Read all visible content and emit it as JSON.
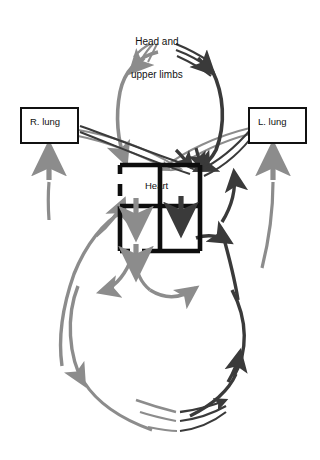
{
  "figure": {
    "background_color": "#ffffff"
  },
  "colors": {
    "oxygenated": "#8c8c8c",
    "deoxygenated": "#3a3a3a",
    "heart_outline": "#0d0d0d",
    "box_outline": "#111111",
    "text": "#111111"
  },
  "labels": {
    "head_line1": "Head and",
    "head_line2": "upper limbs",
    "heart": "Heart",
    "right_lung": "R. lung",
    "left_lung": "L. lung"
  },
  "nodes": [
    {
      "id": "head",
      "name": "head-and-upper-limbs",
      "label": "Head and upper limbs",
      "type": "capillary-bed",
      "x": 168,
      "y": 28
    },
    {
      "id": "heart",
      "name": "heart",
      "label": "Heart",
      "type": "organ-box",
      "x": 160,
      "y": 205
    },
    {
      "id": "rlung",
      "name": "right-lung",
      "label": "R. lung",
      "type": "boxed-organ",
      "x": 49,
      "y": 126
    },
    {
      "id": "llung",
      "name": "left-lung",
      "label": "L. lung",
      "type": "boxed-organ",
      "x": 277,
      "y": 126
    },
    {
      "id": "lower",
      "name": "lower-limbs-trunk",
      "label": "",
      "type": "capillary-bed",
      "x": 178,
      "y": 420
    }
  ],
  "heart_chambers": [
    {
      "id": "la",
      "name": "left-atrium",
      "position": "upper-left",
      "blood": "oxygenated"
    },
    {
      "id": "ra",
      "name": "right-atrium",
      "position": "upper-right",
      "blood": "deoxygenated"
    },
    {
      "id": "lv",
      "name": "left-ventricle",
      "position": "lower-left",
      "blood": "oxygenated"
    },
    {
      "id": "rv",
      "name": "right-ventricle",
      "position": "lower-right",
      "blood": "deoxygenated"
    }
  ],
  "flows": [
    {
      "id": "f1",
      "name": "aorta-to-head",
      "from": "heart",
      "to": "head",
      "blood": "oxygenated"
    },
    {
      "id": "f2",
      "name": "head-to-vena-cava",
      "from": "head",
      "to": "heart",
      "blood": "deoxygenated"
    },
    {
      "id": "f3",
      "name": "right-lung-to-heart",
      "from": "rlung",
      "to": "heart",
      "blood": "oxygenated"
    },
    {
      "id": "f4",
      "name": "left-lung-to-heart",
      "from": "llung",
      "to": "heart",
      "blood": "oxygenated"
    },
    {
      "id": "f5",
      "name": "heart-to-right-lung",
      "from": "heart",
      "to": "rlung",
      "blood": "deoxygenated"
    },
    {
      "id": "f6",
      "name": "heart-to-left-lung",
      "from": "heart",
      "to": "llung",
      "blood": "deoxygenated"
    },
    {
      "id": "f7",
      "name": "aorta-to-lower-body",
      "from": "heart",
      "to": "lower",
      "blood": "oxygenated"
    },
    {
      "id": "f8",
      "name": "lower-body-to-heart",
      "from": "lower",
      "to": "heart",
      "blood": "deoxygenated"
    },
    {
      "id": "f9",
      "name": "left-atrium-to-left-ventricle",
      "from": "la",
      "to": "lv",
      "blood": "oxygenated"
    },
    {
      "id": "f10",
      "name": "right-atrium-to-right-ventricle",
      "from": "ra",
      "to": "rv",
      "blood": "deoxygenated"
    }
  ],
  "legend_note": ""
}
